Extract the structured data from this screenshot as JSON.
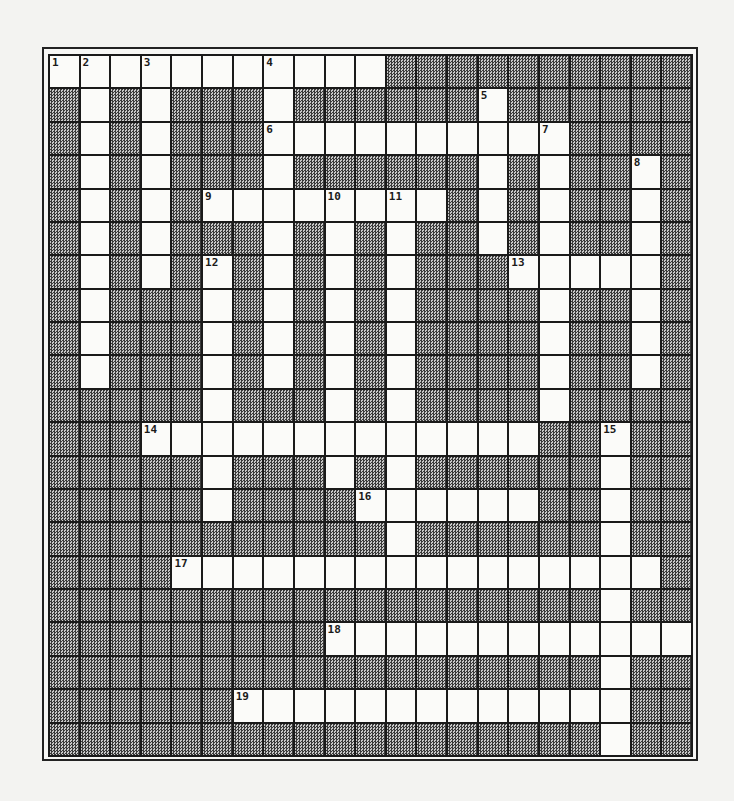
{
  "puzzle": {
    "rows": 21,
    "cols": 21,
    "colors": {
      "block": "#9a9a9a",
      "open": "#fbfbf9",
      "line": "#1a1a1a",
      "page": "#f3f3f1"
    },
    "open_cells": [
      [
        0,
        1,
        2,
        3,
        4,
        5,
        6,
        7,
        8,
        9,
        10
      ],
      [
        1,
        3,
        7,
        14
      ],
      [
        1,
        3,
        7,
        8,
        9,
        10,
        11,
        12,
        13,
        14,
        15,
        16
      ],
      [
        1,
        3,
        7,
        14,
        16,
        19
      ],
      [
        1,
        3,
        5,
        6,
        7,
        8,
        9,
        10,
        11,
        12,
        14,
        16,
        19
      ],
      [
        1,
        3,
        7,
        9,
        11,
        14,
        16,
        19
      ],
      [
        1,
        3,
        5,
        7,
        9,
        11,
        15,
        16,
        17,
        18,
        19
      ],
      [
        1,
        5,
        7,
        9,
        11,
        16,
        19
      ],
      [
        1,
        5,
        7,
        9,
        11,
        16,
        19
      ],
      [
        1,
        5,
        7,
        9,
        11,
        16,
        19
      ],
      [
        5,
        9,
        11,
        16
      ],
      [
        3,
        4,
        5,
        6,
        7,
        8,
        9,
        10,
        11,
        12,
        13,
        14,
        15,
        18
      ],
      [
        5,
        9,
        11,
        18
      ],
      [
        5,
        10,
        11,
        12,
        13,
        14,
        15,
        18
      ],
      [
        11,
        18
      ],
      [
        4,
        5,
        6,
        7,
        8,
        9,
        10,
        11,
        12,
        13,
        14,
        15,
        16,
        17,
        18,
        19
      ],
      [
        18
      ],
      [
        9,
        10,
        11,
        12,
        13,
        14,
        15,
        16,
        17,
        18,
        19,
        20
      ],
      [
        18
      ],
      [
        6,
        7,
        8,
        9,
        10,
        11,
        12,
        13,
        14,
        15,
        16,
        17,
        18
      ],
      [
        18
      ]
    ],
    "numbers": [
      {
        "n": "1",
        "row": 0,
        "col": 0
      },
      {
        "n": "2",
        "row": 0,
        "col": 1
      },
      {
        "n": "3",
        "row": 0,
        "col": 3
      },
      {
        "n": "4",
        "row": 0,
        "col": 7
      },
      {
        "n": "5",
        "row": 1,
        "col": 14
      },
      {
        "n": "6",
        "row": 2,
        "col": 7
      },
      {
        "n": "7",
        "row": 2,
        "col": 16
      },
      {
        "n": "8",
        "row": 3,
        "col": 19
      },
      {
        "n": "9",
        "row": 4,
        "col": 5
      },
      {
        "n": "10",
        "row": 4,
        "col": 9
      },
      {
        "n": "11",
        "row": 4,
        "col": 11
      },
      {
        "n": "12",
        "row": 6,
        "col": 5
      },
      {
        "n": "13",
        "row": 6,
        "col": 15
      },
      {
        "n": "14",
        "row": 11,
        "col": 3
      },
      {
        "n": "15",
        "row": 11,
        "col": 18
      },
      {
        "n": "16",
        "row": 13,
        "col": 10
      },
      {
        "n": "17",
        "row": 15,
        "col": 4
      },
      {
        "n": "18",
        "row": 17,
        "col": 9
      },
      {
        "n": "19",
        "row": 19,
        "col": 6
      }
    ]
  }
}
